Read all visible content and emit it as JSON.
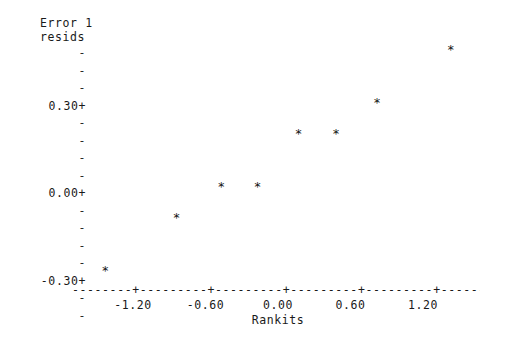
{
  "chart_data": {
    "type": "scatter",
    "title": "",
    "ylabel_lines": [
      "Error 1",
      "resids"
    ],
    "xlabel": "Rankits",
    "x": [
      -1.43,
      -0.84,
      -0.47,
      -0.17,
      0.17,
      0.48,
      0.82,
      1.43
    ],
    "y": [
      -0.46,
      -0.23,
      -0.1,
      -0.1,
      0.13,
      0.13,
      0.26,
      0.49
    ],
    "points": [
      {
        "x": -1.43,
        "y": -0.46,
        "marker": "*"
      },
      {
        "x": -0.84,
        "y": -0.23,
        "marker": "*"
      },
      {
        "x": -0.47,
        "y": -0.1,
        "marker": "*"
      },
      {
        "x": -0.17,
        "y": -0.1,
        "marker": "*"
      },
      {
        "x": 0.17,
        "y": 0.13,
        "marker": "*"
      },
      {
        "x": 0.48,
        "y": 0.13,
        "marker": "*"
      },
      {
        "x": 0.82,
        "y": 0.26,
        "marker": "*"
      },
      {
        "x": 1.43,
        "y": 0.49,
        "marker": "*"
      }
    ],
    "marker_symbol": "*",
    "xlim": [
      -1.66,
      1.65
    ],
    "ylim": [
      -0.6,
      0.62
    ],
    "xticks": [
      -1.2,
      -0.6,
      0.0,
      0.6,
      1.2
    ],
    "xtick_labels": [
      "-1.20",
      "-0.60",
      "0.00",
      "0.60",
      "1.20"
    ],
    "yticks": [
      0.3,
      0.0,
      -0.3
    ],
    "ytick_labels": [
      "0.30+",
      "0.00+",
      "-0.30+"
    ],
    "y_minor_tick_symbol": "-",
    "grid": false,
    "legend": null,
    "axis_line_glyphs": {
      "segment": "-",
      "tick": "+"
    },
    "axis_line_text": "--------+---------+---------+---------+---------+-------"
  },
  "y_axis_rows": [
    {
      "label": "-",
      "kind": "minor"
    },
    {
      "label": "-",
      "kind": "minor"
    },
    {
      "label": "-",
      "kind": "minor"
    },
    {
      "label": "0.30+",
      "kind": "major"
    },
    {
      "label": "-",
      "kind": "minor"
    },
    {
      "label": "-",
      "kind": "minor"
    },
    {
      "label": "-",
      "kind": "minor"
    },
    {
      "label": "-",
      "kind": "minor"
    },
    {
      "label": "0.00+",
      "kind": "major"
    },
    {
      "label": "-",
      "kind": "minor"
    },
    {
      "label": "-",
      "kind": "minor"
    },
    {
      "label": "-",
      "kind": "minor"
    },
    {
      "label": "-",
      "kind": "minor"
    },
    {
      "label": "-0.30+",
      "kind": "major"
    },
    {
      "label": "-",
      "kind": "minor"
    },
    {
      "label": "-",
      "kind": "minor"
    }
  ],
  "colors": {
    "background": "#ffffff",
    "text": "#1a1a1a",
    "marker": "#111111"
  }
}
